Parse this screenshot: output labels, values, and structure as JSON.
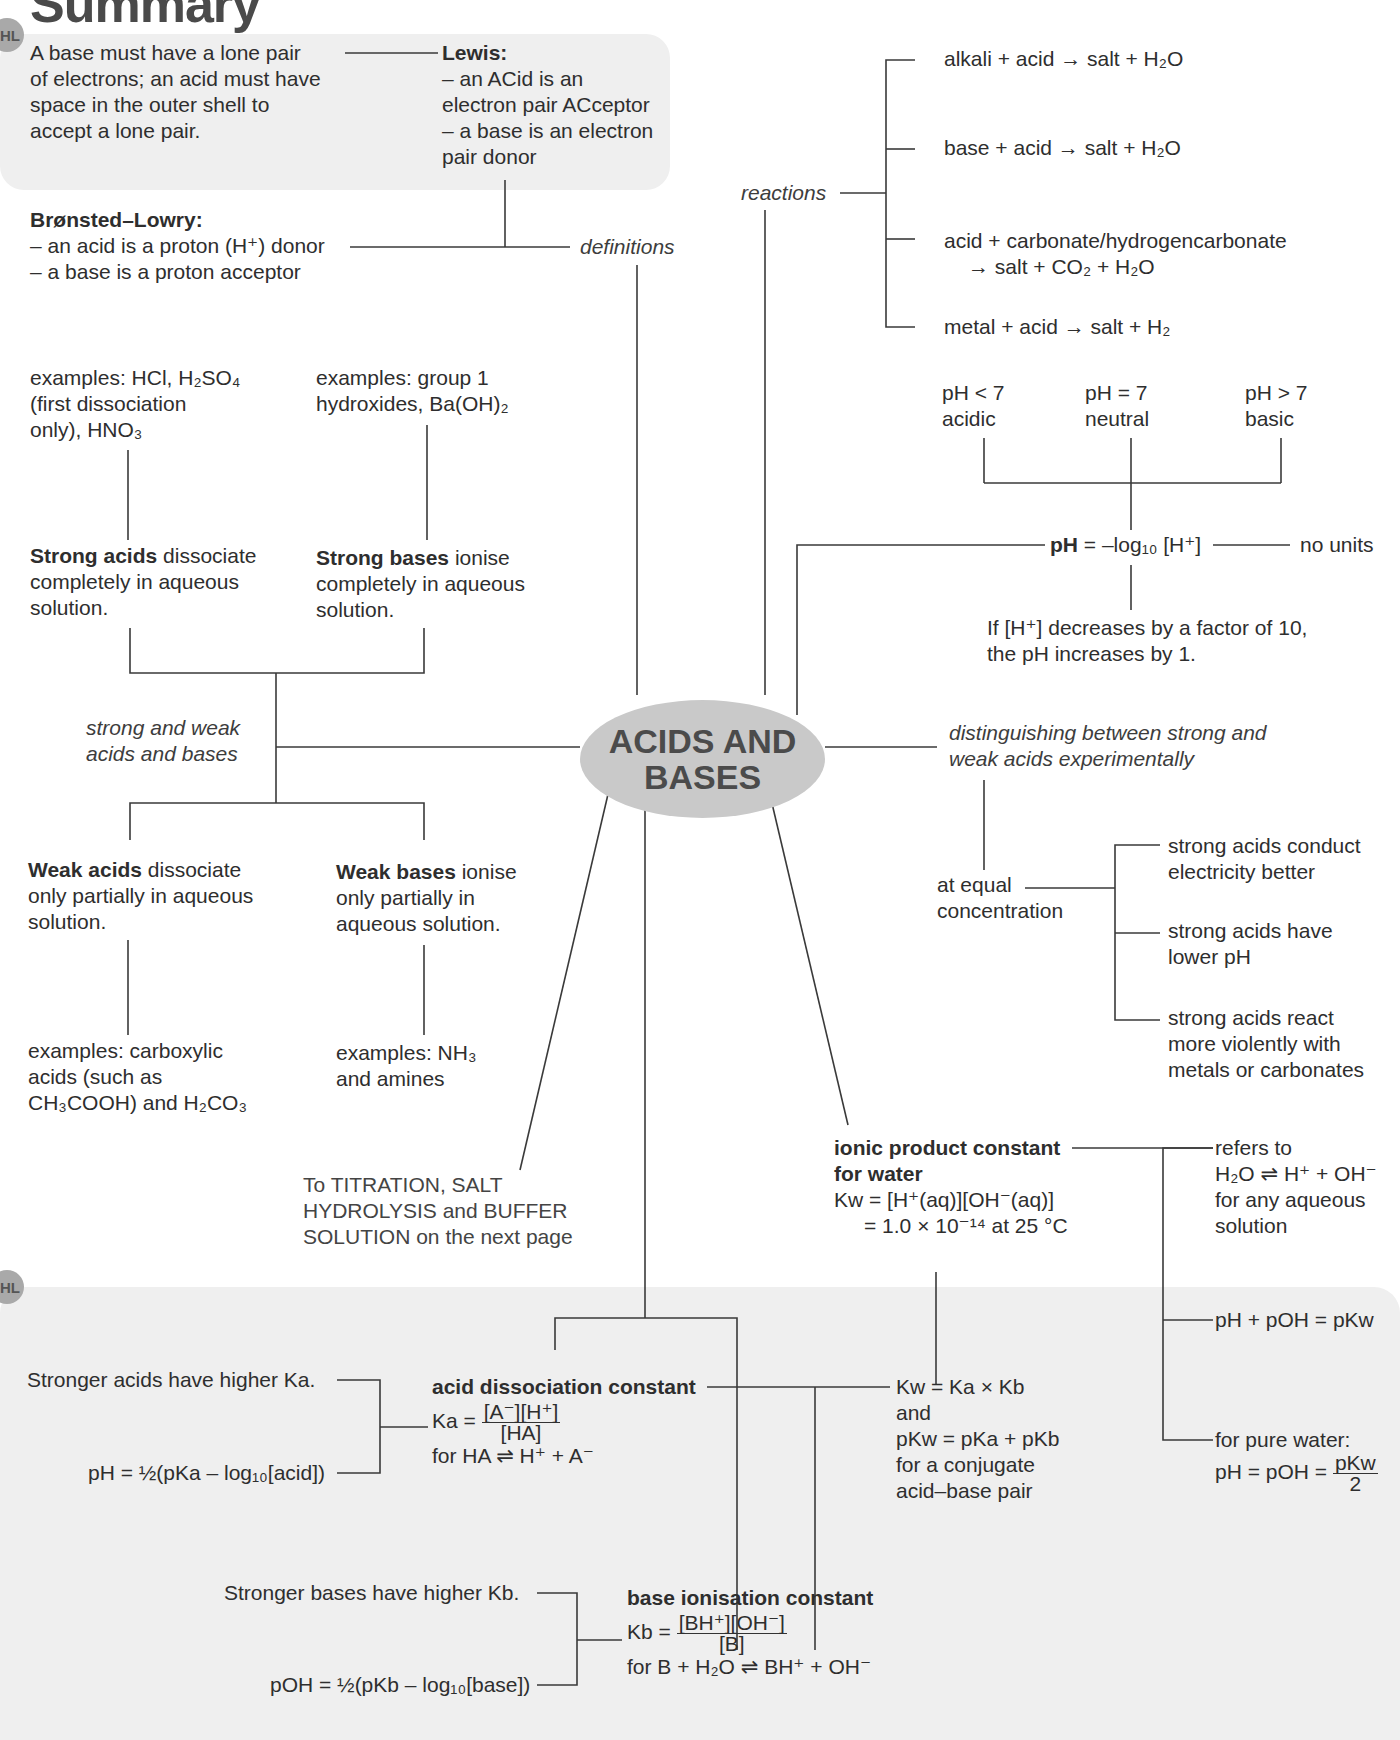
{
  "page": {
    "title": "Summary",
    "hl_badge": "HL"
  },
  "center": {
    "line1": "ACIDS AND",
    "line2": "BASES"
  },
  "definitions": {
    "branch_label": "definitions",
    "lewis_note": [
      "A base must have a lone pair",
      "of electrons; an acid must have",
      "space in the outer shell  to",
      "accept a lone pair."
    ],
    "lewis_heading": "Lewis:",
    "lewis_lines": [
      "– an ACid is an",
      "electron pair ACceptor",
      "– a base is an electron",
      "pair donor"
    ],
    "bronsted_heading": "Brønsted–Lowry:",
    "bronsted_line1": "– an acid is a proton (H⁺) donor",
    "bronsted_line2": "– a base is a proton acceptor"
  },
  "reactions": {
    "branch_label": "reactions",
    "items": [
      "alkali + acid → salt + H₂O",
      "base + acid → salt + H₂O",
      "acid + carbonate/hydrogencarbonate",
      "→ salt + CO₂ + H₂O",
      "metal + acid → salt + H₂"
    ]
  },
  "ph": {
    "scale": [
      {
        "value": "pH < 7",
        "label": "acidic"
      },
      {
        "value": "pH = 7",
        "label": "neutral"
      },
      {
        "value": "pH > 7",
        "label": "basic"
      }
    ],
    "formula_bold": "pH",
    "formula_rest": " = –log₁₀ [H⁺]",
    "units_note": "no units",
    "factor_note_1": "If [H⁺] decreases by a factor of 10,",
    "factor_note_2": "the pH increases by 1."
  },
  "strong_weak": {
    "branch_label_1": "strong and weak",
    "branch_label_2": "acids and bases",
    "strong_acids_examples": [
      "examples: HCl, H₂SO₄",
      "(first dissociation",
      "only), HNO₃"
    ],
    "strong_bases_examples": [
      "examples: group 1",
      "hydroxides, Ba(OH)₂"
    ],
    "strong_acids_bold": "Strong acids",
    "strong_acids_rest": " dissociate",
    "strong_acids_lines": [
      "completely in aqueous",
      "solution."
    ],
    "strong_bases_bold": "Strong bases",
    "strong_bases_rest": " ionise",
    "strong_bases_lines": [
      "completely in aqueous",
      "solution."
    ],
    "weak_acids_bold": "Weak acids",
    "weak_acids_rest": " dissociate",
    "weak_acids_lines": [
      "only partially in aqueous",
      "solution."
    ],
    "weak_bases_bold": "Weak bases",
    "weak_bases_rest": " ionise",
    "weak_bases_lines": [
      "only partially in",
      "aqueous solution."
    ],
    "weak_acids_examples": [
      "examples: carboxylic",
      "acids (such as",
      "CH₃COOH) and H₂CO₃"
    ],
    "weak_bases_examples": [
      "examples: NH₃",
      "and amines"
    ]
  },
  "distinguishing": {
    "branch_label_1": "distinguishing between strong and",
    "branch_label_2": "weak acids experimentally",
    "condition": [
      "at equal",
      "concentration"
    ],
    "results": [
      [
        "strong acids conduct",
        "electricity better"
      ],
      [
        "strong acids have",
        "lower pH"
      ],
      [
        "strong acids react",
        "more violently with",
        "metals or carbonates"
      ]
    ]
  },
  "titration_note": [
    "To TITRATION, SALT",
    "HYDROLYSIS and BUFFER",
    "SOLUTION on the next page"
  ],
  "kw": {
    "heading_1": "ionic product constant",
    "heading_2": "for water",
    "formula_1": "Kw = [H⁺(aq)][OH⁻(aq)]",
    "formula_2": "= 1.0 × 10⁻¹⁴ at 25 °C",
    "refers": [
      "refers to",
      "H₂O ⇌ H⁺ + OH⁻",
      "for any aqueous",
      "solution"
    ],
    "ph_poh": "pH + pOH = pKw",
    "pure_water_label": "for pure water:",
    "pure_water_formula_left": "pH = pOH =",
    "pure_water_num": "pKw",
    "pure_water_den": "2",
    "relation": [
      "Kw = Ka × Kb",
      "and",
      "pKw = pKa + pKb",
      "for a conjugate",
      "acid–base pair"
    ]
  },
  "ka": {
    "note_strength": "Stronger acids have higher Ka.",
    "note_ph": "pH = ½(pKa – log₁₀[acid])",
    "heading": "acid dissociation constant",
    "lhs": "Ka =",
    "num": "[A⁻][H⁺]",
    "den": "[HA]",
    "equilibrium": "for HA ⇌ H⁺ + A⁻"
  },
  "kb": {
    "note_strength": "Stronger bases have higher Kb.",
    "note_poh": "pOH = ½(pKb – log₁₀[base])",
    "heading": "base ionisation constant",
    "lhs": "Kb =",
    "num": "[BH⁺][OH⁻]",
    "den": "[B]",
    "equilibrium": "for B + H₂O ⇌ BH⁺ + OH⁻"
  }
}
